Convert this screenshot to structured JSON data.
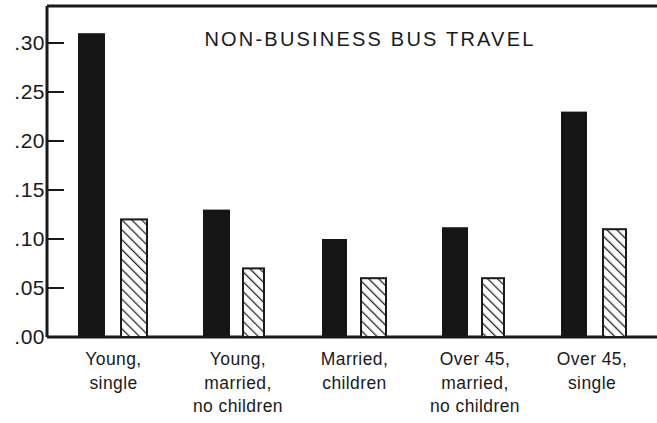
{
  "chart_data": {
    "type": "bar",
    "title": "NON-BUSINESS BUS TRAVEL",
    "xlabel": "",
    "ylabel": "",
    "ylim": [
      0.0,
      0.33
    ],
    "grid": false,
    "legend": "none",
    "ytick_labels": [
      ".30",
      ".25",
      ".20",
      ".15",
      ".10",
      ".05",
      ".00"
    ],
    "ytick_values": [
      0.3,
      0.25,
      0.2,
      0.15,
      0.1,
      0.05,
      0.0
    ],
    "categories": [
      "Young, single",
      "Young, married, no children",
      "Married, children",
      "Over 45, married, no children",
      "Over 45, single"
    ],
    "category_lines": [
      [
        "Young,",
        "single"
      ],
      [
        "Young,",
        "married,",
        "no children"
      ],
      [
        "Married,",
        "children"
      ],
      [
        "Over 45,",
        "married,",
        "no children"
      ],
      [
        "Over 45,",
        "single"
      ]
    ],
    "series": [
      {
        "name": "solid",
        "fill": "solid-black",
        "values": [
          0.31,
          0.13,
          0.1,
          0.112,
          0.23
        ]
      },
      {
        "name": "hatched",
        "fill": "diagonal-hatch",
        "values": [
          0.12,
          0.07,
          0.06,
          0.06,
          0.11
        ]
      }
    ]
  },
  "colors": {
    "axis": "#1a1a1a",
    "solid_bar": "#161616",
    "hatch_line": "#2a2a2a",
    "hatch_background": "#ffffff",
    "background": "#ffffff"
  },
  "geometry": {
    "plot_left": 47,
    "plot_top": 6,
    "plot_right": 657,
    "baseline_y": 337,
    "y_per_unit": 980,
    "bars": [
      {
        "solid_x": 78,
        "solid_w": 27,
        "hatch_x": 121,
        "hatch_w": 26,
        "label_x": 56,
        "label_w": 115
      },
      {
        "solid_x": 203,
        "solid_w": 27,
        "hatch_x": 243,
        "hatch_w": 21,
        "label_x": 178,
        "label_w": 120
      },
      {
        "solid_x": 322,
        "solid_w": 25,
        "hatch_x": 361,
        "hatch_w": 25,
        "label_x": 297,
        "label_w": 115
      },
      {
        "solid_x": 442,
        "solid_w": 26,
        "hatch_x": 482,
        "hatch_w": 22,
        "label_x": 415,
        "label_w": 120
      },
      {
        "solid_x": 561,
        "solid_w": 26,
        "hatch_x": 603,
        "hatch_w": 23,
        "label_x": 533,
        "label_w": 118
      }
    ]
  }
}
